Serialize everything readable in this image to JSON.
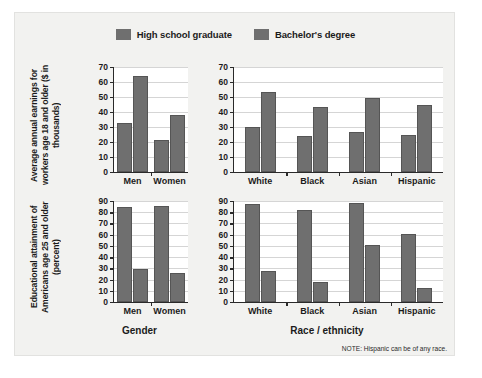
{
  "legend": {
    "entries": [
      {
        "label": "High school graduate",
        "color": "#6f6f6f"
      },
      {
        "label": "Bachelor's degree",
        "color": "#6f6f6f"
      }
    ]
  },
  "note": "NOTE: Hispanic can be of any race.",
  "axis_titles": {
    "earnings": "Average annual earnings for workers age 18 and older ($ in thousands)",
    "attainment": "Educational attainment of Americans age 25 and older (percent)",
    "gender": "Gender",
    "race": "Race / ethnicity"
  },
  "chart_data": [
    {
      "type": "bar",
      "id": "earnings-by-gender",
      "title": "",
      "xlabel": "Gender",
      "ylabel": "Average annual earnings for workers age 18 and older ($ in thousands)",
      "categories": [
        "Men",
        "Women"
      ],
      "yticks": [
        0,
        10,
        20,
        30,
        40,
        50,
        60,
        70
      ],
      "ylim": [
        0,
        70
      ],
      "grid": true,
      "legend_position": "top-center",
      "series": [
        {
          "name": "High school graduate",
          "values": [
            32.5,
            21.5
          ]
        },
        {
          "name": "Bachelor's degree",
          "values": [
            64.0,
            38.0
          ]
        }
      ]
    },
    {
      "type": "bar",
      "id": "earnings-by-race",
      "title": "",
      "xlabel": "Race / ethnicity",
      "ylabel": "Average annual earnings for workers age 18 and older ($ in thousands)",
      "categories": [
        "White",
        "Black",
        "Asian",
        "Hispanic"
      ],
      "yticks": [
        0,
        10,
        20,
        30,
        40,
        50,
        60,
        70
      ],
      "ylim": [
        0,
        70
      ],
      "grid": true,
      "legend_position": "top-center",
      "series": [
        {
          "name": "High school graduate",
          "values": [
            30.0,
            24.0,
            26.5,
            24.5
          ]
        },
        {
          "name": "Bachelor's degree",
          "values": [
            53.5,
            43.5,
            49.5,
            44.5
          ]
        }
      ]
    },
    {
      "type": "bar",
      "id": "attainment-by-gender",
      "title": "",
      "xlabel": "Gender",
      "ylabel": "Educational attainment of Americans age 25 and older (percent)",
      "categories": [
        "Men",
        "Women"
      ],
      "yticks": [
        0,
        10,
        20,
        30,
        40,
        50,
        60,
        70,
        80,
        90
      ],
      "ylim": [
        0,
        90
      ],
      "grid": true,
      "series": [
        {
          "name": "High school graduate",
          "values": [
            84.5,
            85.5
          ]
        },
        {
          "name": "Bachelor's degree",
          "values": [
            29.0,
            26.0
          ]
        }
      ]
    },
    {
      "type": "bar",
      "id": "attainment-by-race",
      "title": "",
      "xlabel": "Race / ethnicity",
      "ylabel": "Educational attainment of Americans age 25 and older (percent)",
      "categories": [
        "White",
        "Black",
        "Asian",
        "Hispanic"
      ],
      "yticks": [
        0,
        10,
        20,
        30,
        40,
        50,
        60,
        70,
        80,
        90
      ],
      "ylim": [
        0,
        90
      ],
      "grid": true,
      "series": [
        {
          "name": "High school graduate",
          "values": [
            87.0,
            82.0,
            88.5,
            61.0
          ]
        },
        {
          "name": "Bachelor's degree",
          "values": [
            28.0,
            18.0,
            50.5,
            12.5
          ]
        }
      ]
    }
  ]
}
